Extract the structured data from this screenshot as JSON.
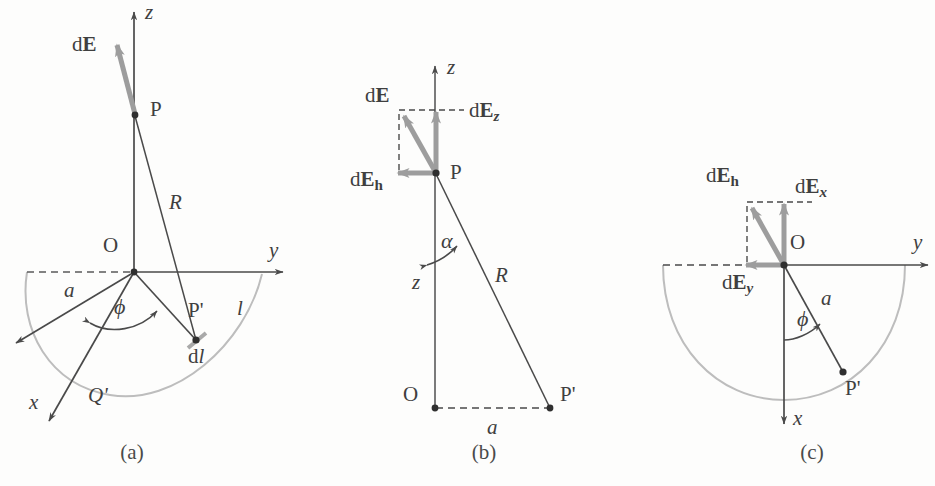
{
  "figure": {
    "stroke_color": "#4a4a4a",
    "vector_color": "#9a9a9a",
    "arc_color": "#b8b8b8"
  },
  "captions": {
    "a": "(a)",
    "b": "(b)",
    "c": "(c)"
  },
  "panel_a": {
    "axis_z": "z",
    "axis_y": "y",
    "axis_x": "x",
    "origin": "O",
    "point_p": "P",
    "point_p_prime": "P'",
    "radius": "a",
    "distance": "R",
    "arc_length": "l",
    "element": "d",
    "element_italic": "l",
    "charge": "Q'",
    "angle": "ϕ",
    "field_prefix": "d",
    "field_vector": "E"
  },
  "panel_b": {
    "axis_z": "z",
    "origin": "O",
    "point_p": "P",
    "point_p_prime": "P'",
    "height": "z",
    "distance": "R",
    "radius": "a",
    "angle": "α",
    "field_prefix": "d",
    "field_vector": "E",
    "field_z_sub": "z",
    "field_h_sub": "h"
  },
  "panel_c": {
    "axis_y": "y",
    "axis_x": "x",
    "origin": "O",
    "point_p_prime": "P'",
    "radius": "a",
    "angle": "ϕ",
    "field_prefix": "d",
    "field_vector": "E",
    "field_x_sub": "x",
    "field_y_sub": "y",
    "field_h_sub": "h"
  }
}
